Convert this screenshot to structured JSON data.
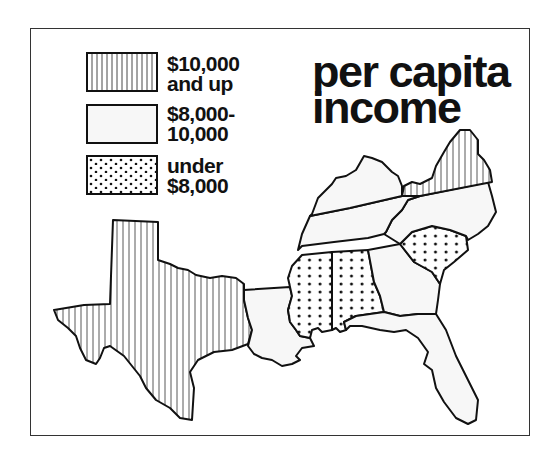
{
  "title": {
    "line1": "per capita",
    "line2": "income"
  },
  "legend": [
    {
      "pattern": "vertical-stripes",
      "line1": "$10,000",
      "line2": "and up"
    },
    {
      "pattern": "plain-light",
      "line1": "$8,000-",
      "line2": "10,000"
    },
    {
      "pattern": "dots",
      "line1": "under",
      "line2": "$8,000"
    }
  ],
  "map": {
    "region": "Southern United States",
    "states": [
      {
        "name": "Texas",
        "category": "$10,000 and up"
      },
      {
        "name": "Virginia",
        "category": "$10,000 and up"
      },
      {
        "name": "Kentucky",
        "category": "$8,000-10,000"
      },
      {
        "name": "Tennessee",
        "category": "$8,000-10,000"
      },
      {
        "name": "North Carolina",
        "category": "$8,000-10,000"
      },
      {
        "name": "Louisiana",
        "category": "$8,000-10,000"
      },
      {
        "name": "Georgia",
        "category": "$8,000-10,000"
      },
      {
        "name": "Florida",
        "category": "$8,000-10,000"
      },
      {
        "name": "Mississippi",
        "category": "under $8,000"
      },
      {
        "name": "Alabama",
        "category": "under $8,000"
      },
      {
        "name": "South Carolina",
        "category": "under $8,000"
      }
    ]
  },
  "colors": {
    "ink": "#111111",
    "fill_light": "#f7f7f7",
    "background": "#ffffff"
  }
}
